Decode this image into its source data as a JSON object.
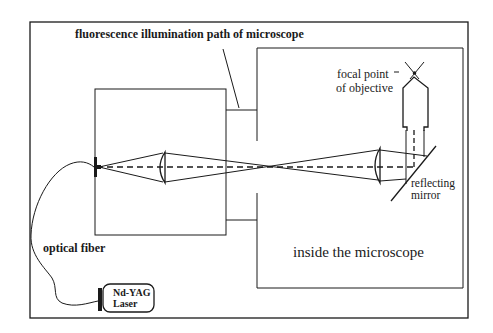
{
  "diagram": {
    "title_label": "fluorescence illumination path of microscope",
    "labels": {
      "focal_point_line1": "focal point",
      "focal_point_line2": "of objective",
      "mirror_line1": "reflecting",
      "mirror_line2": "mirror",
      "inside": "inside the microscope",
      "fiber": "optical fiber",
      "laser_line1": "Nd-YAG",
      "laser_line2": "Laser"
    },
    "components": [
      "outer-frame",
      "coupling-box",
      "microscope-body",
      "fiber-connector",
      "collimating-lens",
      "relay-lens",
      "reflecting-mirror",
      "objective",
      "focal-point",
      "optical-fiber",
      "nd-yag-laser"
    ],
    "colors": {
      "line": "#1a1a1a",
      "background": "#ffffff"
    }
  }
}
